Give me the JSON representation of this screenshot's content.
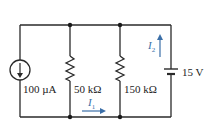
{
  "diagram": {
    "type": "circuit",
    "components": {
      "current_source": {
        "label": "100 µA",
        "direction": "down"
      },
      "resistor_1": {
        "label": "50 kΩ"
      },
      "resistor_2": {
        "label": "150 kΩ"
      },
      "voltage_source": {
        "label": "15 V"
      }
    },
    "currents": {
      "i1": {
        "symbol": "I",
        "sub": "1",
        "direction": "right"
      },
      "i2": {
        "symbol": "I",
        "sub": "2",
        "direction": "up"
      }
    },
    "colors": {
      "wire": "#2a2a2a",
      "current_arrow": "#3b6fa8"
    }
  }
}
